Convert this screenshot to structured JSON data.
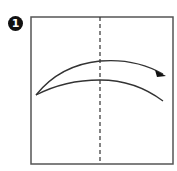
{
  "step": {
    "number": "1"
  },
  "diagram": {
    "paper": {
      "x": 31,
      "y": 17,
      "width": 142,
      "height": 147,
      "stroke": "#555555"
    },
    "fold_line": {
      "type": "valley-dashed",
      "x": 100,
      "stroke": "#333333"
    },
    "arrow": {
      "direction": "left-to-right",
      "stroke": "#333333"
    }
  }
}
